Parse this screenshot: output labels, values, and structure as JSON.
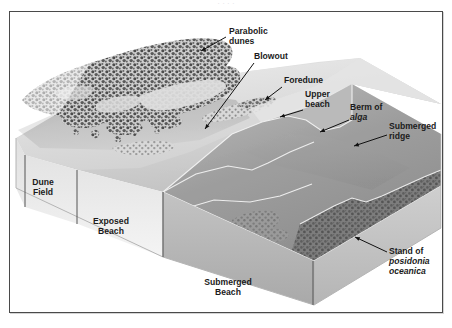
{
  "figure": {
    "kind": "block-diagram",
    "frame_border_color": "#4a4a4a",
    "background_color": "#ffffff",
    "top_clipped_text": "· · · ·"
  },
  "palette": {
    "dune_vegetation_dark": "#4f4f4f",
    "dune_vegetation_mid": "#6f6f6f",
    "sand_light": "#dcdcdc",
    "sand_mid": "#c9c9c9",
    "sand_shadow": "#b0b0b0",
    "water_light": "#e9e9e9",
    "submerged_mid": "#9a9a9a",
    "submerged_dark": "#7c7c7c",
    "posidonia": "#707070",
    "outline_white": "#f2f2f2",
    "label_text": "#1b1b1b",
    "leader_line": "#111111",
    "scale_tick": "#555555"
  },
  "labels": [
    {
      "id": "parabolic-dunes",
      "lines": [
        "Parabolic",
        "dunes"
      ],
      "italic_lines": [
        false,
        false
      ],
      "text_x": 229,
      "text_y": 34,
      "anchor": "start",
      "leader": "M 226 37 L 201 51"
    },
    {
      "id": "blowout",
      "lines": [
        "Blowout"
      ],
      "italic_lines": [
        false
      ],
      "text_x": 254,
      "text_y": 59,
      "anchor": "start",
      "leader": "M 254 63 L 205 129"
    },
    {
      "id": "foredune",
      "lines": [
        "Foredune"
      ],
      "italic_lines": [
        false
      ],
      "text_x": 284,
      "text_y": 83,
      "anchor": "start",
      "leader": "M 282 87 L 265 100"
    },
    {
      "id": "upper-beach",
      "lines": [
        "Upper",
        "beach"
      ],
      "italic_lines": [
        false,
        false
      ],
      "text_x": 305,
      "text_y": 97,
      "anchor": "start",
      "leader": "M 303 110 L 280 117"
    },
    {
      "id": "berm-of-alga",
      "lines": [
        "Berm of",
        "alga"
      ],
      "italic_lines": [
        false,
        true
      ],
      "text_x": 350,
      "text_y": 110,
      "anchor": "start",
      "leader": "M 349 120 L 320 132"
    },
    {
      "id": "submerged-ridge",
      "lines": [
        "Submerged",
        "ridge"
      ],
      "italic_lines": [
        false,
        false
      ],
      "text_x": 389,
      "text_y": 129,
      "anchor": "start",
      "leader": "M 387 135 L 354 146"
    },
    {
      "id": "stand-of-posidonia-oceanica",
      "lines": [
        "Stand of",
        "posidonia",
        "oceanica"
      ],
      "italic_lines": [
        false,
        true,
        true
      ],
      "text_x": 389,
      "text_y": 254,
      "anchor": "start",
      "leader": "M 387 252 L 355 237"
    }
  ],
  "zones": [
    {
      "id": "dune-field",
      "lines": [
        "Dune",
        "Field"
      ],
      "text_x": 43,
      "text_y": 185,
      "anchor": "middle",
      "ticks": [
        "M 25 155 L 25 207",
        "M 77 170 L 77 224"
      ]
    },
    {
      "id": "exposed-beach",
      "lines": [
        "Exposed",
        "Beach"
      ],
      "text_x": 111,
      "text_y": 224,
      "anchor": "middle",
      "ticks": [
        "M 77 170 L 77 224",
        "M 163 192 L 163 257"
      ]
    },
    {
      "id": "submerged-beach",
      "lines": [
        "Submerged",
        "Beach"
      ],
      "text_x": 228,
      "text_y": 285,
      "anchor": "middle",
      "ticks": [
        "M 163 192 L 163 257",
        "M 313 261 L 313 305"
      ]
    }
  ],
  "features": {
    "parabolic_dune_field": "dense stippled vegetated dune mass, upper-left",
    "blowout": "light sand corridor cutting through the dune field",
    "foredune": "low stippled ridge parallel to shoreline",
    "upper_beach": "smooth light sand slope seaward of foredune",
    "berm_of_alga": "darker band along the waterline break-of-slope",
    "submerged_ridge": "subaqueous bar below the water plane",
    "stand_of_posidonia_oceanica": "dark mottled seagrass meadow on the sea floor"
  }
}
